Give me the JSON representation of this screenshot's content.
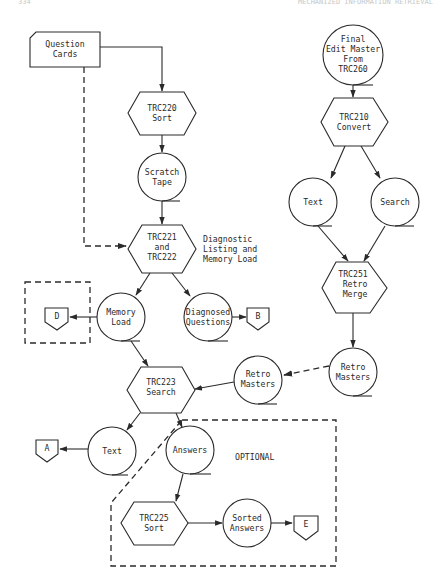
{
  "header": {
    "page_number": "334",
    "running_title": "MECHANIZED INFORMATION RETRIEVAL"
  },
  "nodes": {
    "question_cards": {
      "lines": [
        "Question",
        "Cards"
      ],
      "type": "card"
    },
    "trc220": {
      "lines": [
        "TRC220",
        "Sort"
      ],
      "type": "process"
    },
    "scratch_tape": {
      "lines": [
        "Scratch",
        "Tape"
      ],
      "type": "tape"
    },
    "trc221": {
      "lines": [
        "TRC221",
        "and",
        "TRC222"
      ],
      "type": "process"
    },
    "diagnostic_note": {
      "lines": [
        "Diagnostic",
        "Listing and",
        "Memory Load"
      ],
      "type": "annotation"
    },
    "memory_load": {
      "lines": [
        "Memory",
        "Load"
      ],
      "type": "tape"
    },
    "diagnosed_questions": {
      "lines": [
        "Diagnosed",
        "Questions"
      ],
      "type": "tape"
    },
    "offpage_d": {
      "label": "D",
      "type": "offpage"
    },
    "offpage_b": {
      "label": "B",
      "type": "offpage"
    },
    "final_edit_master": {
      "lines": [
        "Final",
        "Edit Master",
        "From",
        "TRC260"
      ],
      "type": "tape"
    },
    "trc210": {
      "lines": [
        "TRC210",
        "Convert"
      ],
      "type": "process"
    },
    "text_right": {
      "lines": [
        "Text"
      ],
      "type": "tape"
    },
    "search_right": {
      "lines": [
        "Search"
      ],
      "type": "tape"
    },
    "trc251": {
      "lines": [
        "TRC251",
        "Retro",
        "Merge"
      ],
      "type": "process"
    },
    "retro_masters_right": {
      "lines": [
        "Retro",
        "Masters"
      ],
      "type": "tape"
    },
    "retro_masters_mid": {
      "lines": [
        "Retro",
        "Masters"
      ],
      "type": "tape"
    },
    "trc223": {
      "lines": [
        "TRC223",
        "Search"
      ],
      "type": "process"
    },
    "text_lower": {
      "lines": [
        "Text"
      ],
      "type": "tape"
    },
    "offpage_a": {
      "label": "A",
      "type": "offpage"
    },
    "answers": {
      "lines": [
        "Answers"
      ],
      "type": "tape"
    },
    "optional_label": {
      "lines": [
        "OPTIONAL"
      ],
      "type": "annotation"
    },
    "trc225": {
      "lines": [
        "TRC225",
        "Sort"
      ],
      "type": "process"
    },
    "sorted_answers": {
      "lines": [
        "Sorted",
        "Answers"
      ],
      "type": "tape"
    },
    "offpage_e": {
      "label": "E",
      "type": "offpage"
    }
  },
  "edges": [
    {
      "from": "question_cards",
      "to": "trc220",
      "style": "solid"
    },
    {
      "from": "question_cards",
      "to": "trc221",
      "style": "dashed"
    },
    {
      "from": "trc220",
      "to": "scratch_tape",
      "style": "solid"
    },
    {
      "from": "scratch_tape",
      "to": "trc221",
      "style": "solid"
    },
    {
      "from": "trc221",
      "to": "memory_load",
      "style": "solid"
    },
    {
      "from": "trc221",
      "to": "diagnosed_questions",
      "style": "solid"
    },
    {
      "from": "memory_load",
      "to": "offpage_d",
      "style": "solid"
    },
    {
      "from": "diagnosed_questions",
      "to": "offpage_b",
      "style": "solid"
    },
    {
      "from": "memory_load",
      "to": "trc223",
      "style": "solid"
    },
    {
      "from": "final_edit_master",
      "to": "trc210",
      "style": "solid"
    },
    {
      "from": "trc210",
      "to": "text_right",
      "style": "solid"
    },
    {
      "from": "trc210",
      "to": "search_right",
      "style": "solid"
    },
    {
      "from": "text_right",
      "to": "trc251",
      "style": "solid"
    },
    {
      "from": "search_right",
      "to": "trc251",
      "style": "solid"
    },
    {
      "from": "trc251",
      "to": "retro_masters_right",
      "style": "solid"
    },
    {
      "from": "retro_masters_right",
      "to": "retro_masters_mid",
      "style": "dashed"
    },
    {
      "from": "retro_masters_mid",
      "to": "trc223",
      "style": "solid"
    },
    {
      "from": "trc223",
      "to": "text_lower",
      "style": "solid"
    },
    {
      "from": "trc223",
      "to": "answers",
      "style": "solid"
    },
    {
      "from": "text_lower",
      "to": "offpage_a",
      "style": "solid"
    },
    {
      "from": "answers",
      "to": "trc225",
      "style": "solid"
    },
    {
      "from": "trc225",
      "to": "sorted_answers",
      "style": "solid"
    },
    {
      "from": "sorted_answers",
      "to": "offpage_e",
      "style": "solid"
    }
  ],
  "groups": {
    "optional_region": {
      "label": "OPTIONAL",
      "style": "dashed"
    },
    "d_region": {
      "style": "dashed"
    }
  }
}
